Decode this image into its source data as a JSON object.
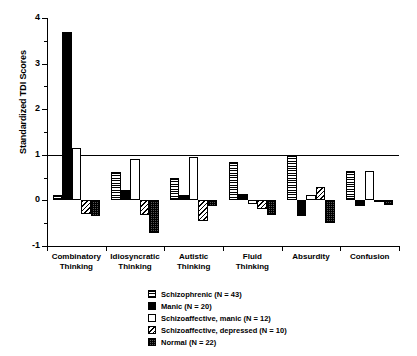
{
  "chart_data": {
    "type": "bar",
    "title": "",
    "subtitle": "",
    "xlabel": "",
    "ylabel": "Standardized TDI Scores",
    "ylim": [
      -1,
      4
    ],
    "yticks": [
      -1,
      0,
      1,
      2,
      3,
      4
    ],
    "ytick_labels": [
      "-1",
      "0",
      "1",
      "2",
      "3",
      "4"
    ],
    "minor_yticks": [
      -0.5,
      0.5,
      1.5,
      2.5,
      3.5
    ],
    "grid": false,
    "legend_position": "below-center",
    "categories": [
      "Combinatory Thinking",
      "Idiosyncratic Thinking",
      "Autistic Thinking",
      "Fluid Thinking",
      "Absurdity",
      "Confusion"
    ],
    "category_lines": [
      [
        "Combinatory",
        "Thinking"
      ],
      [
        "Idiosyncratic",
        "Thinking"
      ],
      [
        "Autistic",
        "Thinking"
      ],
      [
        "Fluid",
        "Thinking"
      ],
      [
        "Absurdity",
        ""
      ],
      [
        "Confusion",
        ""
      ]
    ],
    "series": [
      {
        "name": "Schizophrenic (N = 43)",
        "pattern": "horizontal-stripes",
        "values": [
          0.12,
          0.62,
          0.5,
          0.85,
          1.0,
          0.65
        ]
      },
      {
        "name": "Manic (N = 20)",
        "pattern": "solid-black",
        "values": [
          3.7,
          0.22,
          0.12,
          0.15,
          -0.35,
          -0.12
        ]
      },
      {
        "name": "Schizoaffective, manic (N = 12)",
        "pattern": "open-white",
        "values": [
          1.15,
          0.9,
          0.95,
          -0.07,
          0.12,
          0.65
        ]
      },
      {
        "name": "Schizoaffective, depressed (N = 10)",
        "pattern": "diagonal-hatch",
        "values": [
          -0.3,
          -0.32,
          -0.45,
          -0.18,
          0.3,
          -0.02
        ]
      },
      {
        "name": "Normal (N = 22)",
        "pattern": "dotted-dark",
        "values": [
          -0.35,
          -0.72,
          -0.12,
          -0.32,
          -0.5,
          -0.1
        ]
      }
    ]
  },
  "legend": {
    "items": [
      {
        "label": "Schizophrenic (N = 43)",
        "pattern": "horizontal-stripes"
      },
      {
        "label": "Manic (N = 20)",
        "pattern": "solid-black"
      },
      {
        "label": "Schizoaffective, manic (N = 12)",
        "pattern": "open-white"
      },
      {
        "label": "Schizoaffective, depressed (N = 10)",
        "pattern": "diagonal-hatch"
      },
      {
        "label": "Normal (N = 22)",
        "pattern": "dotted-dark"
      }
    ]
  },
  "colors": {
    "foreground": "#000000",
    "background": "#ffffff",
    "dotted_fill": "#555555"
  }
}
